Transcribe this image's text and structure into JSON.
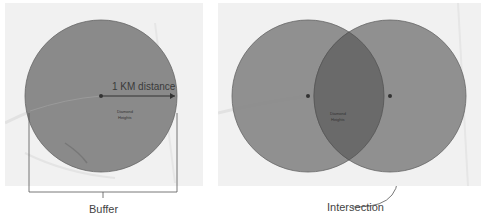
{
  "left_diagram": {
    "distance_label": "1 KM distance",
    "place_label_line1": "Diamond",
    "place_label_line2": "Heights",
    "caption": "Buffer"
  },
  "right_diagram": {
    "place_label_line1": "Diamond",
    "place_label_line2": "Heights",
    "caption": "Intersection"
  },
  "colors": {
    "map_background": "#f1f1f1",
    "buffer_fill": "#8a8a8a",
    "intersection_fill": "#6a6a6a",
    "outline": "#555555"
  }
}
